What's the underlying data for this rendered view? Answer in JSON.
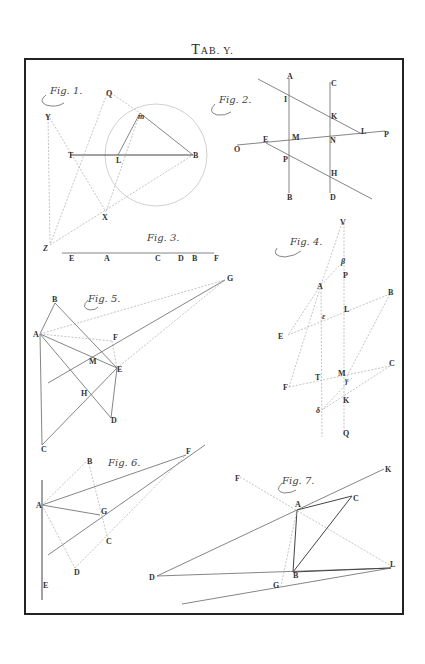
{
  "plate": {
    "title_prefix": "T",
    "title_rest": "AB. Y.",
    "frame_color": "#222222"
  },
  "figures": [
    {
      "id": "fig1",
      "caption": "Fig. 1.",
      "points": [
        "Q",
        "Y",
        "m",
        "T",
        "L",
        "B",
        "X",
        "Z"
      ],
      "labels": {
        "Q": "Q",
        "Y": "Y",
        "m": "m",
        "T": "T",
        "L": "L",
        "B": "B",
        "X": "X",
        "Z": "Z"
      }
    },
    {
      "id": "fig2",
      "caption": "Fig. 2.",
      "points": [
        "A",
        "C",
        "I",
        "K",
        "L",
        "P",
        "O",
        "E",
        "M",
        "N",
        "P2",
        "H",
        "B",
        "D"
      ],
      "labels": {
        "A": "A",
        "C": "C",
        "I": "I",
        "K": "K",
        "L": "L",
        "P": "P",
        "O": "O",
        "E": "E",
        "M": "M",
        "N": "N",
        "P2": "P",
        "H": "H",
        "B": "B",
        "D": "D"
      }
    },
    {
      "id": "fig3",
      "caption": "Fig. 3.",
      "points": [
        "E",
        "A",
        "C",
        "D",
        "B",
        "F"
      ],
      "labels": {
        "E": "E",
        "A": "A",
        "C": "C",
        "D": "D",
        "B": "B",
        "F": "F"
      }
    },
    {
      "id": "fig4",
      "caption": "Fig. 4.",
      "points": [
        "V",
        "beta",
        "P",
        "A",
        "B",
        "L",
        "epsilon",
        "E",
        "M",
        "gamma",
        "C",
        "T",
        "F",
        "K",
        "delta",
        "Q"
      ],
      "labels": {
        "V": "V",
        "beta": "β",
        "P": "P",
        "A": "A",
        "B": "B",
        "L": "L",
        "epsilon": "ε",
        "E": "E",
        "M": "M",
        "gamma": "γ",
        "C": "C",
        "T": "T",
        "F": "F",
        "K": "K",
        "delta": "δ",
        "Q": "Q"
      }
    },
    {
      "id": "fig5",
      "caption": "Fig. 5.",
      "points": [
        "B",
        "A",
        "F",
        "M",
        "E",
        "H",
        "D",
        "C",
        "G"
      ],
      "labels": {
        "B": "B",
        "A": "A",
        "F": "F",
        "M": "M",
        "E": "E",
        "H": "H",
        "D": "D",
        "C": "C",
        "G": "G"
      }
    },
    {
      "id": "fig6",
      "caption": "Fig. 6.",
      "points": [
        "B",
        "F",
        "A",
        "G",
        "C",
        "D",
        "E"
      ],
      "labels": {
        "B": "B",
        "F": "F",
        "A": "A",
        "G": "G",
        "C": "C",
        "D": "D",
        "E": "E"
      }
    },
    {
      "id": "fig7",
      "caption": "Fig. 7.",
      "points": [
        "F",
        "K",
        "A",
        "C",
        "D",
        "B",
        "L",
        "G"
      ],
      "labels": {
        "F": "F",
        "K": "K",
        "A": "A",
        "C": "C",
        "D": "D",
        "B": "B",
        "L": "L",
        "G": "G"
      }
    }
  ]
}
